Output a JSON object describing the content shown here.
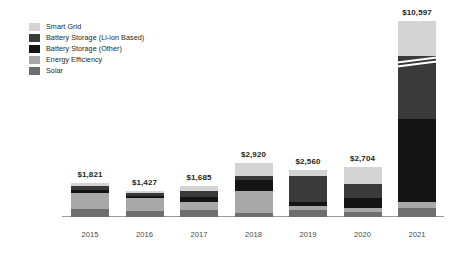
{
  "chart_data": {
    "type": "bar",
    "subtype": "stacked",
    "title": "",
    "subtitle": "",
    "xlabel": "",
    "ylabel": "",
    "categories": [
      "2015",
      "2016",
      "2017",
      "2018",
      "2019",
      "2020",
      "2021"
    ],
    "grid": false,
    "legend_position": "top-left",
    "axis_break": {
      "present": true,
      "on_category": "2021",
      "description": "diagonal white break lines across the 2021 bar"
    },
    "value_label_prefix": "$",
    "totals": [
      1821,
      1427,
      1685,
      2920,
      2560,
      2704,
      10597
    ],
    "total_labels": [
      "$1,821",
      "$1,427",
      "$1,685",
      "$2,920",
      "$2,560",
      "$2,704",
      "$10,597"
    ],
    "series": [
      {
        "name": "Smart Grid",
        "color": "#d4d4d4",
        "values": [
          170,
          140,
          300,
          700,
          330,
          900,
          1900
        ]
      },
      {
        "name": "Battery Storage (Li-ion Based)",
        "color": "#3a3a3a",
        "values": [
          210,
          130,
          330,
          230,
          1430,
          780,
          3400
        ]
      },
      {
        "name": "Battery Storage (Other)",
        "color": "#141414",
        "values": [
          120,
          150,
          230,
          590,
          190,
          530,
          4500
        ]
      },
      {
        "name": "Energy Efficiency",
        "color": "#a8a8a8",
        "values": [
          880,
          700,
          420,
          1160,
          260,
          240,
          300
        ]
      },
      {
        "name": "Solar",
        "color": "#6e6e6e",
        "values": [
          441,
          307,
          405,
          240,
          350,
          254,
          497
        ]
      }
    ]
  },
  "legend": {
    "items": [
      {
        "label": "Smart Grid",
        "color": "#d4d4d4"
      },
      {
        "label": "Battery Storage (Li-ion Based)",
        "color": "#3a3a3a"
      },
      {
        "label": "Battery Storage (Other)",
        "color": "#141414"
      },
      {
        "label": "Energy Efficiency",
        "color": "#a8a8a8"
      },
      {
        "label": "Solar",
        "color": "#6e6e6e"
      }
    ]
  },
  "axis": {
    "baseline_color": "#9a9a9a"
  }
}
